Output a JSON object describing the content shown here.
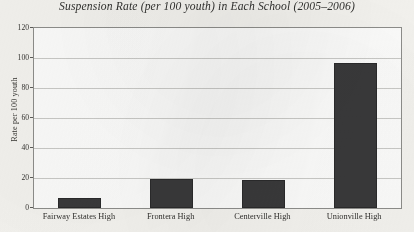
{
  "chart_data": {
    "type": "bar",
    "title": "Suspension Rate (per 100 youth) in Each School (2005–2006)",
    "xlabel": "",
    "ylabel": "Rate per 100 youth",
    "categories": [
      "Fairway Estates High",
      "Frontera High",
      "Centerville High",
      "Unionville High"
    ],
    "values": [
      7,
      19.5,
      19,
      96.5
    ],
    "ylim": [
      0,
      120
    ],
    "ytick_values": [
      0,
      20,
      40,
      60,
      80,
      100,
      120
    ],
    "ytick_labels": [
      "0",
      "20",
      "40",
      "60",
      "80",
      "100",
      "120"
    ],
    "grid": true,
    "legend": false,
    "legend_position": "none",
    "bar_color": "#39393a",
    "plot_background": "#fbfbfa",
    "page_background": "#f3f2ee",
    "gridline_color": "#c9c9c6",
    "axis_color": "#8d8d8a"
  }
}
